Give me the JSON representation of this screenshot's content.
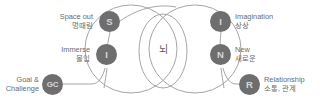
{
  "diagram": {
    "center": {
      "label": "뇌"
    },
    "colors": {
      "background": "#ffffff",
      "outline": "#9b9b9b",
      "badge_fill": "#6e6e6e",
      "badge_text": "#d8d8d8",
      "label_text": "#6b6b6b",
      "center_text": "#5d5d5d"
    },
    "nodes": [
      {
        "id": "space-out",
        "initials": "S",
        "en": "Space out",
        "ko": "멍때림",
        "side": "left"
      },
      {
        "id": "imagination",
        "initials": "I",
        "en": "Imagination",
        "ko": "상상",
        "side": "right"
      },
      {
        "id": "immerse",
        "initials": "I",
        "en": "Immerse",
        "ko": "몰입",
        "side": "left"
      },
      {
        "id": "new",
        "initials": "N",
        "en": "New",
        "ko": "새로운",
        "side": "right"
      },
      {
        "id": "goal-challenge",
        "initials": "GC",
        "en": "Goal &",
        "ko": "Challenge",
        "side": "left"
      },
      {
        "id": "relationship",
        "initials": "R",
        "en": "Relationship",
        "ko": "소통, 관계",
        "side": "right"
      }
    ]
  }
}
